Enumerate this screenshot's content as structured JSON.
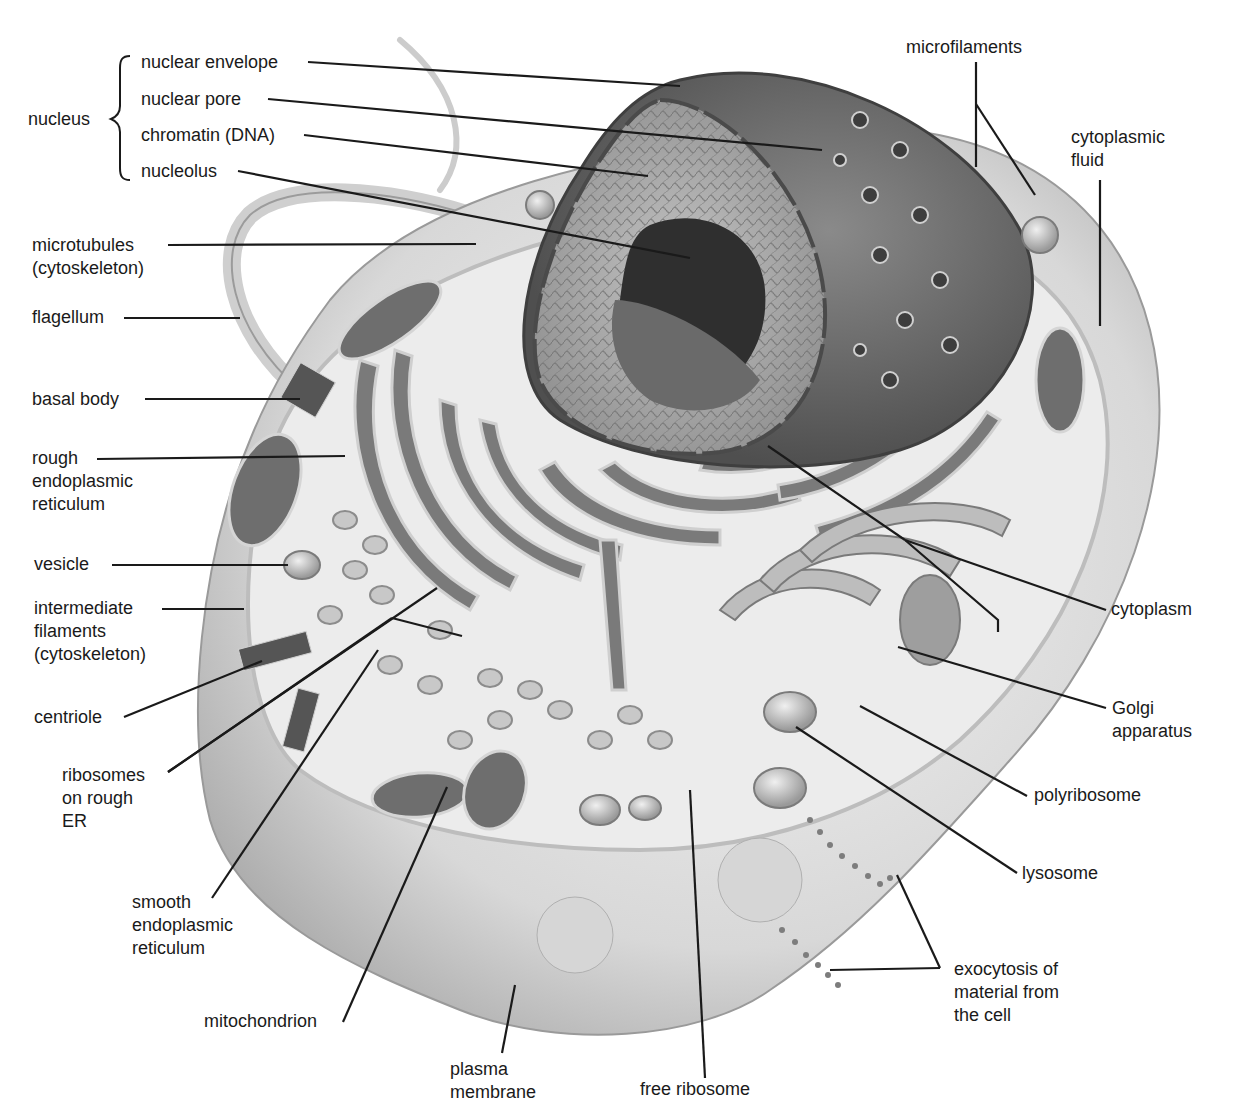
{
  "diagram": {
    "group_label": "nucleus",
    "labels": [
      {
        "id": "nuclear-envelope",
        "text": "nuclear envelope",
        "x": 141,
        "y": 51,
        "group": "nucleus"
      },
      {
        "id": "nuclear-pore",
        "text": "nuclear pore",
        "x": 141,
        "y": 88,
        "group": "nucleus"
      },
      {
        "id": "chromatin",
        "text": "chromatin (DNA)",
        "x": 141,
        "y": 124,
        "group": "nucleus"
      },
      {
        "id": "nucleolus",
        "text": "nucleolus",
        "x": 141,
        "y": 160,
        "group": "nucleus"
      },
      {
        "id": "nucleus",
        "text": "nucleus",
        "x": 28,
        "y": 108
      },
      {
        "id": "microtubules",
        "text": "microtubules\n(cytoskeleton)",
        "x": 32,
        "y": 234
      },
      {
        "id": "flagellum",
        "text": "flagellum",
        "x": 32,
        "y": 306
      },
      {
        "id": "basal-body",
        "text": "basal body",
        "x": 32,
        "y": 388
      },
      {
        "id": "rough-er",
        "text": "rough\nendoplasmic\nreticulum",
        "x": 32,
        "y": 447
      },
      {
        "id": "vesicle",
        "text": "vesicle",
        "x": 34,
        "y": 553
      },
      {
        "id": "intermediate-filaments",
        "text": "intermediate\nfilaments\n(cytoskeleton)",
        "x": 34,
        "y": 597
      },
      {
        "id": "centriole",
        "text": "centriole",
        "x": 34,
        "y": 706
      },
      {
        "id": "ribosomes-on-rough-er",
        "text": "ribosomes\non rough\nER",
        "x": 62,
        "y": 764
      },
      {
        "id": "smooth-er",
        "text": "smooth\nendoplasmic\nreticulum",
        "x": 132,
        "y": 891
      },
      {
        "id": "mitochondrion",
        "text": "mitochondrion",
        "x": 204,
        "y": 1010
      },
      {
        "id": "plasma-membrane",
        "text": "plasma\nmembrane",
        "x": 450,
        "y": 1058
      },
      {
        "id": "free-ribosome",
        "text": "free ribosome",
        "x": 640,
        "y": 1078
      },
      {
        "id": "exocytosis",
        "text": "exocytosis of\nmaterial from\nthe cell",
        "x": 954,
        "y": 958
      },
      {
        "id": "lysosome",
        "text": "lysosome",
        "x": 1022,
        "y": 862
      },
      {
        "id": "polyribosome",
        "text": "polyribosome",
        "x": 1034,
        "y": 784
      },
      {
        "id": "golgi-apparatus",
        "text": "Golgi\napparatus",
        "x": 1112,
        "y": 697
      },
      {
        "id": "cytoplasm",
        "text": "cytoplasm",
        "x": 1111,
        "y": 598
      },
      {
        "id": "microfilaments",
        "text": "microfilaments",
        "x": 906,
        "y": 36
      },
      {
        "id": "cytoplasmic-fluid",
        "text": "cytoplasmic\nfluid",
        "x": 1071,
        "y": 126
      }
    ],
    "leader_lines": [
      {
        "for": "nuclear-envelope",
        "points": [
          [
            308,
            62
          ],
          [
            680,
            86
          ]
        ]
      },
      {
        "for": "nuclear-pore",
        "points": [
          [
            268,
            99
          ],
          [
            822,
            150
          ]
        ]
      },
      {
        "for": "chromatin",
        "points": [
          [
            304,
            135
          ],
          [
            648,
            176
          ]
        ]
      },
      {
        "for": "nucleolus",
        "points": [
          [
            238,
            171
          ],
          [
            690,
            258
          ]
        ]
      },
      {
        "for": "microtubules",
        "points": [
          [
            168,
            245
          ],
          [
            476,
            244
          ]
        ]
      },
      {
        "for": "flagellum",
        "points": [
          [
            124,
            318
          ],
          [
            240,
            318
          ]
        ]
      },
      {
        "for": "basal-body",
        "points": [
          [
            145,
            399
          ],
          [
            300,
            399
          ]
        ]
      },
      {
        "for": "rough-er",
        "points": [
          [
            97,
            459
          ],
          [
            345,
            456
          ]
        ]
      },
      {
        "for": "vesicle",
        "points": [
          [
            112,
            565
          ],
          [
            288,
            565
          ]
        ]
      },
      {
        "for": "intermediate-filaments",
        "points": [
          [
            162,
            609
          ],
          [
            244,
            609
          ]
        ]
      },
      {
        "for": "centriole",
        "points": [
          [
            124,
            717
          ],
          [
            262,
            661
          ]
        ]
      },
      {
        "for": "ribosomes-on-rough-er",
        "points": [
          [
            168,
            772
          ],
          [
            437,
            588
          ]
        ]
      },
      {
        "for": "ribosomes-on-rough-er-2",
        "points": [
          [
            168,
            772
          ],
          [
            392,
            618
          ]
        ]
      },
      {
        "for": "ribosomes-on-rough-er-3",
        "points": [
          [
            392,
            618
          ],
          [
            462,
            636
          ]
        ]
      },
      {
        "for": "smooth-er",
        "points": [
          [
            212,
            898
          ],
          [
            378,
            650
          ]
        ]
      },
      {
        "for": "mitochondrion",
        "points": [
          [
            343,
            1022
          ],
          [
            447,
            787
          ]
        ]
      },
      {
        "for": "plasma-membrane",
        "points": [
          [
            502,
            1053
          ],
          [
            515,
            985
          ]
        ]
      },
      {
        "for": "free-ribosome",
        "points": [
          [
            705,
            1078
          ],
          [
            690,
            790
          ]
        ]
      },
      {
        "for": "exocytosis-1",
        "points": [
          [
            940,
            968
          ],
          [
            897,
            875
          ]
        ]
      },
      {
        "for": "exocytosis-2",
        "points": [
          [
            940,
            968
          ],
          [
            830,
            970
          ]
        ]
      },
      {
        "for": "lysosome",
        "points": [
          [
            1017,
            873
          ],
          [
            796,
            727
          ]
        ]
      },
      {
        "for": "polyribosome",
        "points": [
          [
            1027,
            796
          ],
          [
            860,
            706
          ]
        ]
      },
      {
        "for": "golgi-apparatus",
        "points": [
          [
            1106,
            708
          ],
          [
            898,
            647
          ]
        ]
      },
      {
        "for": "cytoplasm-1",
        "points": [
          [
            1106,
            610
          ],
          [
            905,
            540
          ]
        ]
      },
      {
        "for": "cytoplasm-2",
        "points": [
          [
            905,
            540
          ],
          [
            998,
            620
          ],
          [
            998,
            632
          ]
        ]
      },
      {
        "for": "cytoplasm-3",
        "points": [
          [
            905,
            540
          ],
          [
            768,
            446
          ]
        ]
      },
      {
        "for": "microfilaments-1",
        "points": [
          [
            976,
            62
          ],
          [
            976,
            167
          ]
        ]
      },
      {
        "for": "microfilaments-2",
        "points": [
          [
            976,
            104
          ],
          [
            1035,
            195
          ]
        ]
      },
      {
        "for": "cytoplasmic-fluid",
        "points": [
          [
            1100,
            180
          ],
          [
            1100,
            326
          ]
        ]
      }
    ]
  },
  "colors": {
    "background": "#ffffff",
    "text": "#1a1a1a",
    "line": "#1a1a1a",
    "membrane_light": "#e6e6e6",
    "membrane_mid": "#c9c9c9",
    "cytoplasm": "#efefef",
    "organelle_dark": "#595959",
    "nucleus_envelope": "#6d6d6d",
    "chromatin": "#a8a8a8",
    "nucleolus": "#3a3a3a"
  }
}
